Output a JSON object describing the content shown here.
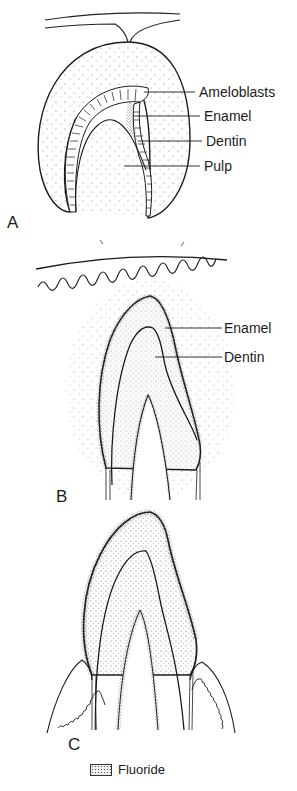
{
  "figure": {
    "panels": [
      {
        "id": "A",
        "letter": "A",
        "labels": [
          "Ameloblasts",
          "Enamel",
          "Dentin",
          "Pulp"
        ]
      },
      {
        "id": "B",
        "letter": "B",
        "labels": [
          "Enamel",
          "Dentin"
        ],
        "marks": [
          "\\ ꟸI",
          "H /"
        ]
      },
      {
        "id": "C",
        "letter": "C",
        "labels": []
      }
    ],
    "legend": {
      "label": "Fluoride",
      "swatch": "stippled-pattern"
    },
    "colors": {
      "ink": "#1c1c1c",
      "background": "#ffffff",
      "stipple": "#555555"
    }
  }
}
